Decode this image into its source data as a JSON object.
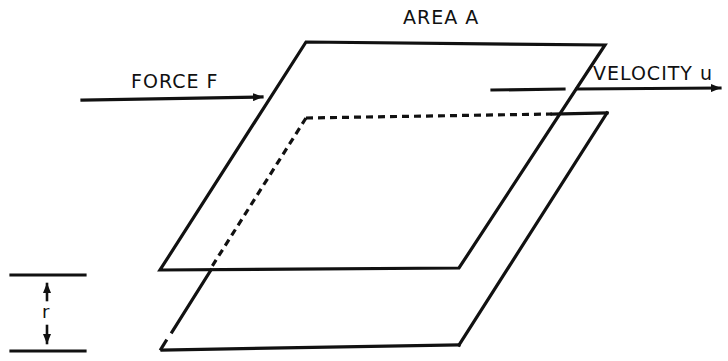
{
  "diagram": {
    "labels": {
      "area": "AREA  A",
      "force": "FORCE  F",
      "velocity": "VELOCITY  u",
      "separation": "r"
    },
    "elements": {
      "top_plate": {
        "desc": "moving plate of area A",
        "corners": [
          [
            306,
            42
          ],
          [
            605,
            45
          ],
          [
            459,
            268
          ],
          [
            160,
            270
          ]
        ]
      },
      "bottom_plate": {
        "desc": "stationary plate",
        "corners": [
          [
            306,
            118
          ],
          [
            607,
            113
          ],
          [
            459,
            345
          ],
          [
            160,
            350
          ]
        ],
        "hidden_edges": "dashed"
      },
      "force_arrow": {
        "from": [
          82,
          100
        ],
        "to": [
          263,
          97
        ]
      },
      "velocity_arrow": {
        "from": [
          492,
          90
        ],
        "to": [
          722,
          88
        ]
      },
      "separation_marker": {
        "top_line_y": 275,
        "bottom_line_y": 351,
        "x": 47
      }
    },
    "colors": {
      "ink": "#111111",
      "background": "#ffffff"
    }
  }
}
